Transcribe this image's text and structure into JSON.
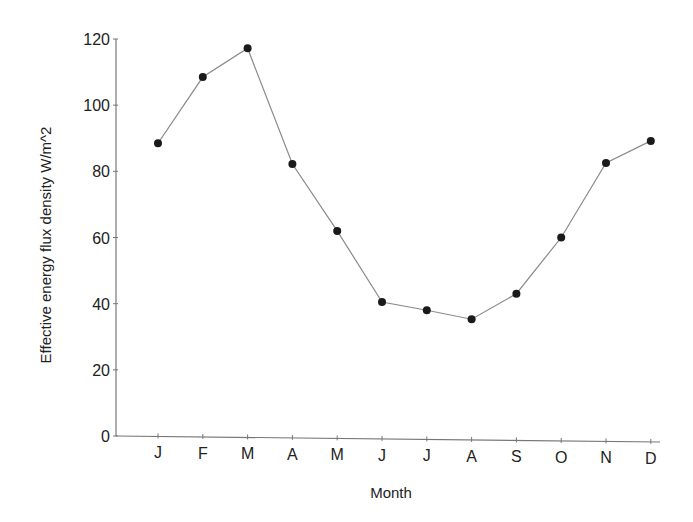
{
  "chart_data": {
    "type": "line",
    "title": "",
    "xlabel": "Month",
    "ylabel": "Effective energy flux density W/m^2",
    "categories": [
      "J",
      "F",
      "M",
      "A",
      "M",
      "J",
      "J",
      "A",
      "S",
      "O",
      "N",
      "D"
    ],
    "series": [
      {
        "name": "Effective energy flux density",
        "values": [
          88.5,
          108.5,
          117.2,
          82.2,
          62,
          40.5,
          38,
          35.3,
          43,
          60,
          82.5,
          89.2
        ],
        "marker": "filled-circle",
        "color": "#1a1a1a",
        "line_color": "#8a8a8a"
      }
    ],
    "ylim": [
      0,
      120
    ],
    "yticks": [
      0,
      20,
      40,
      60,
      80,
      100,
      120
    ],
    "grid": false,
    "legend": null
  },
  "layout": {
    "plot_left": 116,
    "plot_right": 660,
    "y_zero_px": 436,
    "y_top_px": 39,
    "x_first_px": 158,
    "x_step_px": 44.8
  }
}
